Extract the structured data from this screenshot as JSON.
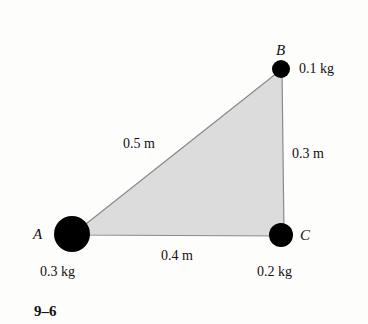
{
  "figure": {
    "label": "9–6",
    "fill_color": "#dcdcdc",
    "edge_color": "#8a8a8a",
    "mass_color": "#000000"
  },
  "points": {
    "A": {
      "name": "A",
      "mass": "0.3 kg"
    },
    "B": {
      "name": "B",
      "mass": "0.1 kg"
    },
    "C": {
      "name": "C",
      "mass": "0.2 kg"
    }
  },
  "sides": {
    "AB": "0.5 m",
    "BC": "0.3 m",
    "AC": "0.4 m"
  }
}
